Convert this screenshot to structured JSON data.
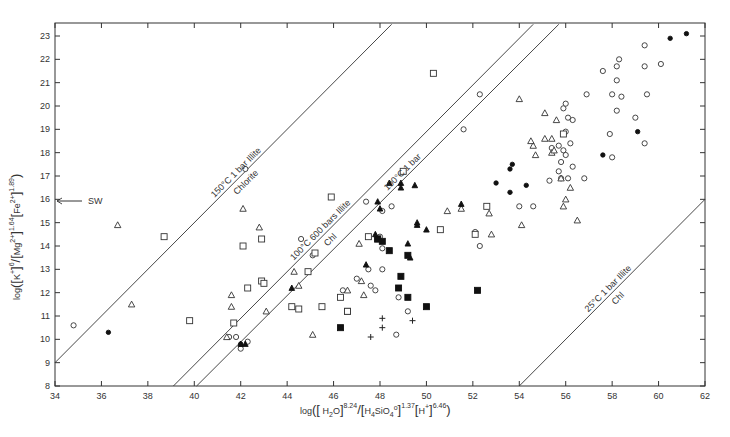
{
  "chart_data": {
    "type": "scatter",
    "title": "",
    "xlabel": "log([H2O]^8.24 / [H4SiO4°]^1.37 [H+]^6.46)",
    "ylabel": "log([K+]^6 / [Mg2+]^1.64 [Fe2+]^1.89)",
    "xlim": [
      34,
      62
    ],
    "ylim": [
      8,
      23.5
    ],
    "xticks": [
      34,
      36,
      38,
      40,
      42,
      44,
      46,
      48,
      50,
      52,
      54,
      56,
      58,
      60,
      62
    ],
    "yticks": [
      8,
      9,
      10,
      11,
      12,
      13,
      14,
      15,
      16,
      17,
      18,
      19,
      20,
      21,
      22,
      23
    ],
    "grid": false,
    "legend": null,
    "annotations": [
      {
        "text": "SW",
        "x": 34,
        "y": 14.7,
        "arrow": "left"
      }
    ],
    "boundary_lines": [
      {
        "name": "150C-1bar",
        "label_above": "150°C  1 bar   Illite",
        "label_below": "Chlorite",
        "x": [
          34,
          48.5
        ],
        "y": [
          9,
          23.5
        ]
      },
      {
        "name": "100C-600bars",
        "label_above": "100°C  600 bars   Illite",
        "label_below": "Chl",
        "x": [
          39.1,
          54.6
        ],
        "y": [
          8,
          23.5
        ]
      },
      {
        "name": "100C-1bar",
        "label_above": "100°C  1 bar",
        "label_below": "",
        "x": [
          40.1,
          55.7
        ],
        "y": [
          8,
          23.5
        ]
      },
      {
        "name": "25C-1bar",
        "label_above": "25°C  1 bar   Illite",
        "label_below": "Chl",
        "x": [
          54,
          62
        ],
        "y": [
          8,
          16
        ]
      }
    ],
    "series": [
      {
        "name": "open-circle",
        "marker": "circle-open",
        "points": [
          [
            34.8,
            10.6
          ],
          [
            41.5,
            10.1
          ],
          [
            41.8,
            10.1
          ],
          [
            42.0,
            9.6
          ],
          [
            42.3,
            9.9
          ],
          [
            42.2,
            17.3
          ],
          [
            44.6,
            14.3
          ],
          [
            45.1,
            13.6
          ],
          [
            46.4,
            12.1
          ],
          [
            47.0,
            12.6
          ],
          [
            47.5,
            13.0
          ],
          [
            47.8,
            12.1
          ],
          [
            48.0,
            14.4
          ],
          [
            48.1,
            13.9
          ],
          [
            47.6,
            12.3
          ],
          [
            47.4,
            15.9
          ],
          [
            48.1,
            15.5
          ],
          [
            48.1,
            13.0
          ],
          [
            48.8,
            11.8
          ],
          [
            48.7,
            10.2
          ],
          [
            49.2,
            11.2
          ],
          [
            48.5,
            15.7
          ],
          [
            51.6,
            19.0
          ],
          [
            52.3,
            20.5
          ],
          [
            52.1,
            14.6
          ],
          [
            52.3,
            14.0
          ],
          [
            54.6,
            15.7
          ],
          [
            54.0,
            15.7
          ],
          [
            55.4,
            18.2
          ],
          [
            55.7,
            18.3
          ],
          [
            55.9,
            18.1
          ],
          [
            55.7,
            17.2
          ],
          [
            56.0,
            18.9
          ],
          [
            55.3,
            16.8
          ],
          [
            55.8,
            16.9
          ],
          [
            56.0,
            17.9
          ],
          [
            56.1,
            16.9
          ],
          [
            55.8,
            17.6
          ],
          [
            56.1,
            19.5
          ],
          [
            56.8,
            16.9
          ],
          [
            56.9,
            20.5
          ],
          [
            57.6,
            21.5
          ],
          [
            58.0,
            20.5
          ],
          [
            58.2,
            21.1
          ],
          [
            58.2,
            21.7
          ],
          [
            58.3,
            22.0
          ],
          [
            58.4,
            20.4
          ],
          [
            58.2,
            19.8
          ],
          [
            57.9,
            18.8
          ],
          [
            58.0,
            17.8
          ],
          [
            59.0,
            19.5
          ],
          [
            59.4,
            21.7
          ],
          [
            59.4,
            22.6
          ],
          [
            59.5,
            20.5
          ],
          [
            59.4,
            18.4
          ],
          [
            60.1,
            21.8
          ],
          [
            56.2,
            18.4
          ],
          [
            56.3,
            17.4
          ],
          [
            55.9,
            19.9
          ],
          [
            56.0,
            20.1
          ],
          [
            56.3,
            19.4
          ]
        ]
      },
      {
        "name": "filled-circle",
        "marker": "circle-filled",
        "points": [
          [
            36.3,
            10.3
          ],
          [
            42.0,
            9.8
          ],
          [
            53.0,
            16.7
          ],
          [
            53.6,
            17.3
          ],
          [
            53.7,
            17.5
          ],
          [
            53.6,
            16.3
          ],
          [
            54.3,
            16.6
          ],
          [
            57.6,
            17.9
          ],
          [
            59.1,
            18.9
          ],
          [
            60.5,
            22.9
          ],
          [
            61.2,
            23.1
          ]
        ]
      },
      {
        "name": "open-triangle",
        "marker": "triangle-open",
        "points": [
          [
            36.7,
            14.9
          ],
          [
            37.3,
            11.5
          ],
          [
            41.6,
            11.9
          ],
          [
            41.6,
            11.4
          ],
          [
            41.4,
            10.1
          ],
          [
            42.1,
            15.6
          ],
          [
            42.8,
            14.8
          ],
          [
            43.1,
            11.2
          ],
          [
            44.3,
            12.9
          ],
          [
            44.5,
            12.3
          ],
          [
            45.1,
            10.2
          ],
          [
            46.6,
            12.1
          ],
          [
            47.2,
            12.5
          ],
          [
            47.3,
            11.9
          ],
          [
            47.1,
            14.1
          ],
          [
            50.9,
            15.5
          ],
          [
            51.5,
            15.6
          ],
          [
            52.7,
            15.4
          ],
          [
            52.8,
            14.5
          ],
          [
            54.0,
            20.3
          ],
          [
            54.1,
            14.9
          ],
          [
            54.6,
            18.3
          ],
          [
            54.7,
            17.9
          ],
          [
            54.5,
            18.5
          ],
          [
            55.1,
            18.6
          ],
          [
            55.4,
            18.0
          ],
          [
            55.4,
            18.6
          ],
          [
            55.8,
            16.9
          ],
          [
            56.5,
            15.1
          ],
          [
            55.1,
            19.7
          ],
          [
            55.6,
            19.4
          ],
          [
            55.5,
            18.1
          ],
          [
            55.9,
            15.7
          ],
          [
            56.0,
            16.0
          ],
          [
            56.2,
            16.5
          ]
        ]
      },
      {
        "name": "filled-triangle",
        "marker": "triangle-filled",
        "points": [
          [
            42.0,
            9.8
          ],
          [
            44.2,
            12.2
          ],
          [
            47.4,
            13.2
          ],
          [
            47.9,
            15.9
          ],
          [
            48.0,
            15.6
          ],
          [
            48.4,
            16.7
          ],
          [
            48.9,
            16.7
          ],
          [
            48.9,
            16.5
          ],
          [
            49.5,
            16.6
          ],
          [
            49.6,
            15.0
          ],
          [
            49.6,
            14.9
          ],
          [
            49.3,
            13.5
          ],
          [
            49.2,
            14.1
          ],
          [
            50.0,
            14.7
          ],
          [
            51.5,
            15.8
          ],
          [
            47.8,
            14.5
          ],
          [
            42.2,
            9.8
          ]
        ]
      },
      {
        "name": "open-square",
        "marker": "square-open",
        "points": [
          [
            38.7,
            14.4
          ],
          [
            39.8,
            10.8
          ],
          [
            41.7,
            10.7
          ],
          [
            42.1,
            14.0
          ],
          [
            42.3,
            12.2
          ],
          [
            42.9,
            14.3
          ],
          [
            42.9,
            12.5
          ],
          [
            43.0,
            12.4
          ],
          [
            44.5,
            11.3
          ],
          [
            44.9,
            12.9
          ],
          [
            45.2,
            13.7
          ],
          [
            45.5,
            11.4
          ],
          [
            45.9,
            16.1
          ],
          [
            46.3,
            11.8
          ],
          [
            46.6,
            11.2
          ],
          [
            47.5,
            14.4
          ],
          [
            47.9,
            14.3
          ],
          [
            49.0,
            17.2
          ],
          [
            50.3,
            21.4
          ],
          [
            50.6,
            14.7
          ],
          [
            52.1,
            14.5
          ],
          [
            52.6,
            15.7
          ],
          [
            55.9,
            18.8
          ],
          [
            46.6,
            11.2
          ],
          [
            44.2,
            11.4
          ]
        ]
      },
      {
        "name": "filled-square",
        "marker": "square-filled",
        "points": [
          [
            46.3,
            10.5
          ],
          [
            47.9,
            14.3
          ],
          [
            48.1,
            14.2
          ],
          [
            48.4,
            13.8
          ],
          [
            48.9,
            12.7
          ],
          [
            48.8,
            12.2
          ],
          [
            49.2,
            11.8
          ],
          [
            49.2,
            13.6
          ],
          [
            50.0,
            11.4
          ],
          [
            52.2,
            12.1
          ]
        ]
      },
      {
        "name": "plus",
        "marker": "plus",
        "points": [
          [
            48.1,
            10.9
          ],
          [
            48.1,
            10.5
          ],
          [
            47.6,
            10.1
          ],
          [
            49.4,
            10.8
          ]
        ]
      }
    ]
  },
  "axes": {
    "x_tick_labels": [
      "34",
      "36",
      "38",
      "40",
      "42",
      "44",
      "46",
      "48",
      "50",
      "52",
      "54",
      "56",
      "58",
      "60",
      "62"
    ],
    "y_tick_labels": [
      "8",
      "9",
      "10",
      "11",
      "12",
      "13",
      "14",
      "15",
      "16",
      "17",
      "18",
      "19",
      "20",
      "21",
      "22",
      "23"
    ],
    "sw_label": "SW"
  }
}
